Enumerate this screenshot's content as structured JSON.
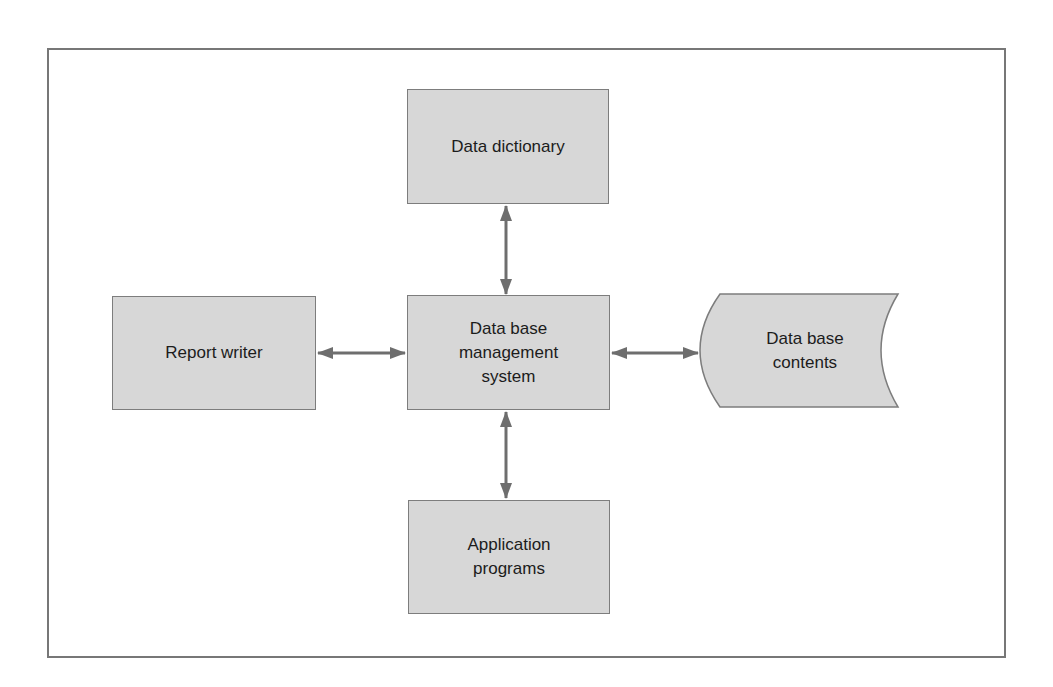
{
  "diagram": {
    "type": "block-diagram",
    "colors": {
      "frame": "#777777",
      "box_fill": "#d7d7d7",
      "box_border": "#7d7d7d",
      "arrow": "#6e6e6e",
      "text": "#1c1c1c"
    },
    "nodes": {
      "data_dictionary": {
        "label": "Data dictionary",
        "shape": "rectangle"
      },
      "report_writer": {
        "label": "Report writer",
        "shape": "rectangle"
      },
      "dbms": {
        "label": "Data base\nmanagement\nsystem",
        "shape": "rectangle"
      },
      "db_contents": {
        "label": "Data base\ncontents",
        "shape": "stored-data"
      },
      "application_programs": {
        "label": "Application\nprograms",
        "shape": "rectangle"
      }
    },
    "edges": [
      {
        "from": "dbms",
        "to": "data_dictionary",
        "direction": "bidirectional"
      },
      {
        "from": "report_writer",
        "to": "dbms",
        "direction": "bidirectional"
      },
      {
        "from": "dbms",
        "to": "db_contents",
        "direction": "bidirectional"
      },
      {
        "from": "dbms",
        "to": "application_programs",
        "direction": "bidirectional"
      }
    ]
  }
}
